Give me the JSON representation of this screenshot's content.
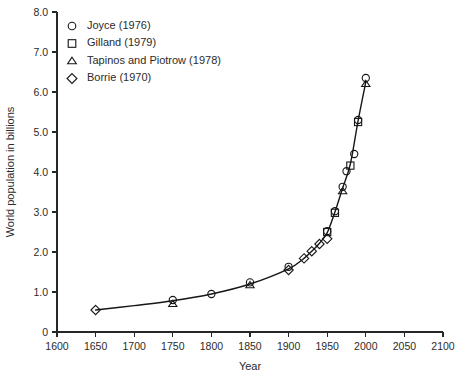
{
  "chart_data": {
    "type": "scatter",
    "title": "",
    "xlabel": "Year",
    "ylabel": "World population in billions",
    "xlim": [
      1600,
      2100
    ],
    "ylim": [
      0,
      8.0
    ],
    "xticks": [
      1600,
      1650,
      1700,
      1750,
      1800,
      1850,
      1900,
      1950,
      2000,
      2050,
      2100
    ],
    "yticks": [
      0,
      1.0,
      2.0,
      3.0,
      4.0,
      5.0,
      6.0,
      7.0,
      8.0
    ],
    "ytick_labels": [
      "0",
      "1.0",
      "2.0",
      "3.0",
      "4.0",
      "5.0",
      "6.0",
      "7.0",
      "8.0"
    ],
    "xtick_labels": [
      "1600",
      "1650",
      "1700",
      "1750",
      "1800",
      "1850",
      "1900",
      "1950",
      "2000",
      "2050",
      "2100"
    ],
    "grid": false,
    "legend_position": "top-left",
    "series": [
      {
        "name": "Joyce (1976)",
        "marker": "circle",
        "points": [
          {
            "x": 1750,
            "y": 0.8
          },
          {
            "x": 1800,
            "y": 0.95
          },
          {
            "x": 1850,
            "y": 1.24
          },
          {
            "x": 1900,
            "y": 1.63
          },
          {
            "x": 1950,
            "y": 2.52
          },
          {
            "x": 1960,
            "y": 3.02
          },
          {
            "x": 1970,
            "y": 3.63
          },
          {
            "x": 1975,
            "y": 4.02
          },
          {
            "x": 1985,
            "y": 4.45
          },
          {
            "x": 1990,
            "y": 5.3
          },
          {
            "x": 2000,
            "y": 6.35
          }
        ]
      },
      {
        "name": "Gilland (1979)",
        "marker": "square",
        "points": [
          {
            "x": 1950,
            "y": 2.5
          },
          {
            "x": 1960,
            "y": 2.98
          },
          {
            "x": 1980,
            "y": 4.16
          },
          {
            "x": 1990,
            "y": 5.25
          }
        ]
      },
      {
        "name": "Tapinos and Piotrow (1978)",
        "marker": "triangle",
        "points": [
          {
            "x": 1750,
            "y": 0.7
          },
          {
            "x": 1850,
            "y": 1.17
          },
          {
            "x": 1970,
            "y": 3.52
          },
          {
            "x": 2000,
            "y": 6.2
          }
        ]
      },
      {
        "name": "Borrie (1970)",
        "marker": "diamond",
        "points": [
          {
            "x": 1650,
            "y": 0.55
          },
          {
            "x": 1900,
            "y": 1.55
          },
          {
            "x": 1920,
            "y": 1.84
          },
          {
            "x": 1930,
            "y": 2.02
          },
          {
            "x": 1940,
            "y": 2.2
          },
          {
            "x": 1950,
            "y": 2.33
          }
        ]
      }
    ],
    "curve": [
      {
        "x": 1650,
        "y": 0.55
      },
      {
        "x": 1700,
        "y": 0.66
      },
      {
        "x": 1750,
        "y": 0.78
      },
      {
        "x": 1800,
        "y": 0.95
      },
      {
        "x": 1850,
        "y": 1.2
      },
      {
        "x": 1900,
        "y": 1.58
      },
      {
        "x": 1920,
        "y": 1.84
      },
      {
        "x": 1930,
        "y": 2.02
      },
      {
        "x": 1940,
        "y": 2.22
      },
      {
        "x": 1950,
        "y": 2.48
      },
      {
        "x": 1960,
        "y": 3.0
      },
      {
        "x": 1970,
        "y": 3.6
      },
      {
        "x": 1980,
        "y": 4.2
      },
      {
        "x": 1990,
        "y": 5.28
      },
      {
        "x": 2000,
        "y": 6.25
      }
    ]
  },
  "legend": {
    "entries": [
      {
        "label": "Joyce (1976)",
        "marker": "circle"
      },
      {
        "label": "Gilland (1979)",
        "marker": "square"
      },
      {
        "label": "Tapinos and Piotrow (1978)",
        "marker": "triangle"
      },
      {
        "label": "Borrie (1970)",
        "marker": "diamond"
      }
    ]
  },
  "colors": {
    "line": "#161616",
    "marker": "#161616",
    "axis": "#262626",
    "text": "#2b2b2b",
    "background": "#ffffff"
  }
}
